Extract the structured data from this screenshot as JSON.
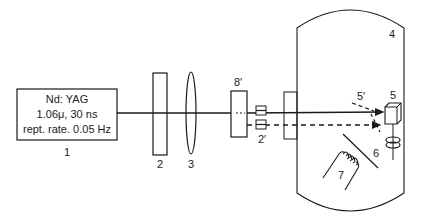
{
  "diagram": {
    "laser": {
      "line1": "Nd: YAG",
      "line2": "1.06μ, 30 ns",
      "line3": "rept. rate. 0.05 Hz",
      "label": "1"
    },
    "labels": {
      "plate": "2",
      "lens": "3",
      "chamber": "4",
      "target": "5",
      "beam_reflection": "5′",
      "shield": "6",
      "heater": "7",
      "element_8": "8′",
      "element_2prime": "2′"
    },
    "colors": {
      "line": "#1a1a1a",
      "background": "#ffffff"
    }
  }
}
